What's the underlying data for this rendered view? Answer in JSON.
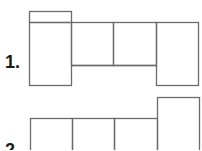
{
  "figures": [
    {
      "label": "1.",
      "description": "Net of rectangular faces: left tall panel with small top tab, two middle cells over a lower strip, right tall panel"
    },
    {
      "label": "2.",
      "description": "Net of rectangular faces: three cells in a row with a taller panel on the right"
    }
  ],
  "colors": {
    "line": "#6b6b6b",
    "text": "#1a1a1a",
    "background": "#ffffff"
  }
}
